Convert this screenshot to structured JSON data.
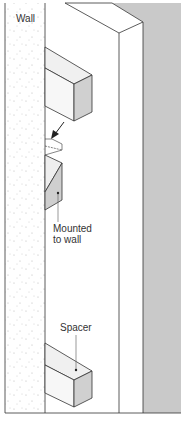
{
  "diagram": {
    "labels": {
      "wall": "Wall",
      "mounted_line1": "Mounted",
      "mounted_line2": "to wall",
      "spacer": "Spacer"
    },
    "caption": "",
    "colors": {
      "wall_fill": "#ffffff",
      "wall_stipple": "#bdbdbd",
      "panel_face": "#ffffff",
      "shadow_band": "#c9c9c9",
      "block_top": "#f0f0f0",
      "block_side": "#d0d0d0",
      "outline": "#333333"
    }
  }
}
